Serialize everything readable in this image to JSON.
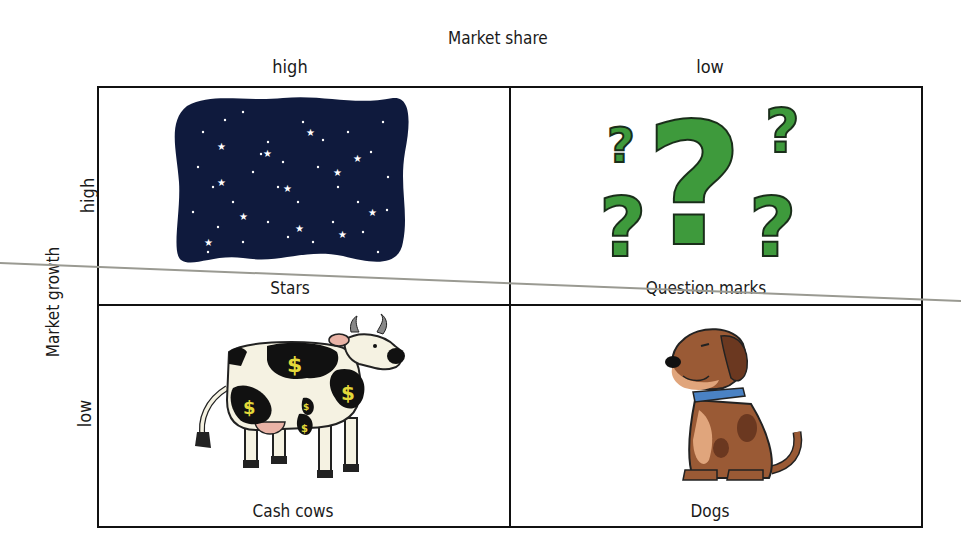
{
  "header": {
    "x_axis_title": "Market share",
    "x_high": "high",
    "x_low": "low"
  },
  "side": {
    "y_axis_title": "Market growth",
    "y_high": "high",
    "y_low": "low"
  },
  "quadrants": [
    {
      "label": "Stars",
      "icon": "night-sky-stars-icon",
      "position": "top-left"
    },
    {
      "label": "Question marks",
      "icon": "question-marks-icon",
      "position": "top-right"
    },
    {
      "label": "Cash cows",
      "icon": "cow-with-dollar-spots-icon",
      "position": "bottom-left"
    },
    {
      "label": "Dogs",
      "icon": "sitting-dog-icon",
      "position": "bottom-right"
    }
  ],
  "colors": {
    "grid_line": "#111111",
    "night_sky": "#0f1a3d",
    "question_green": "#3e9a3c",
    "dollar_yellow": "#e3d93a",
    "dog_brown": "#9a5a35",
    "dog_collar": "#4a82c4"
  }
}
